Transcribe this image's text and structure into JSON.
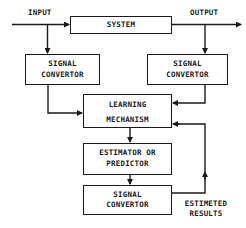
{
  "diagram": {
    "labels": {
      "input": "INPUT",
      "output": "OUTPUT",
      "estimated_results_1": "ESTIMETED",
      "estimated_results_2": "RESULTS"
    },
    "boxes": {
      "system": "SYSTEM",
      "signal_convertor_left": [
        "SIGNAL",
        "CONVERTOR"
      ],
      "signal_convertor_right": [
        "SIGNAL",
        "CONVERTOR"
      ],
      "learning_mechanism": [
        "LEARNING",
        "MECHANISM"
      ],
      "estimator": [
        "ESTIMATOR OR",
        "PREDICTOR"
      ],
      "signal_convertor_bottom": [
        "SIGNAL",
        "CONVERTOR"
      ]
    },
    "colors": {
      "line": "#1a1a1a",
      "background": "#ffffff"
    }
  }
}
